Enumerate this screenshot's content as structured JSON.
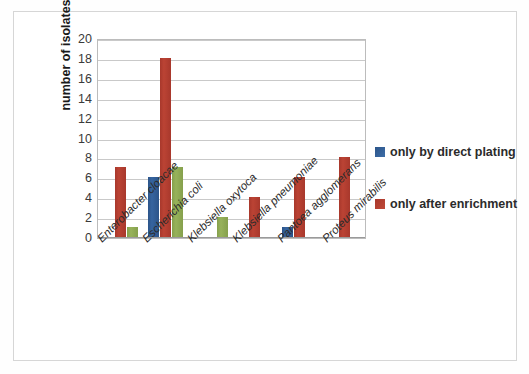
{
  "chart_data": {
    "type": "bar",
    "title": "",
    "xlabel": "",
    "ylabel": "number of isolates",
    "ylim": [
      0,
      20
    ],
    "ytick_step": 2,
    "yticks": [
      20,
      18,
      16,
      14,
      12,
      10,
      8,
      6,
      4,
      2,
      0
    ],
    "grid": true,
    "legend_position": "right",
    "categories": [
      "Enterobacter cloacae",
      "Escherichia coli",
      "Klebsiella oxytoca",
      "Klebsiella pneumoniae",
      "Pantoea agglomerans",
      "Proteus mirabilis"
    ],
    "series": [
      {
        "name": "only by direct plating",
        "color": "#2c5489",
        "in_legend": true,
        "values": [
          0,
          6,
          0,
          0,
          1,
          0
        ]
      },
      {
        "name": "only after enrichment",
        "color": "#a8382c",
        "in_legend": true,
        "values": [
          7,
          18,
          0,
          4,
          6,
          8
        ]
      },
      {
        "name": "",
        "color": "#85a04c",
        "in_legend": false,
        "values": [
          1,
          7,
          2,
          0,
          0,
          0
        ]
      }
    ]
  },
  "legend": {
    "items": [
      {
        "label": "only by direct plating",
        "color": "#2c5489"
      },
      {
        "label": "only after enrichment",
        "color": "#a8382c"
      }
    ]
  }
}
